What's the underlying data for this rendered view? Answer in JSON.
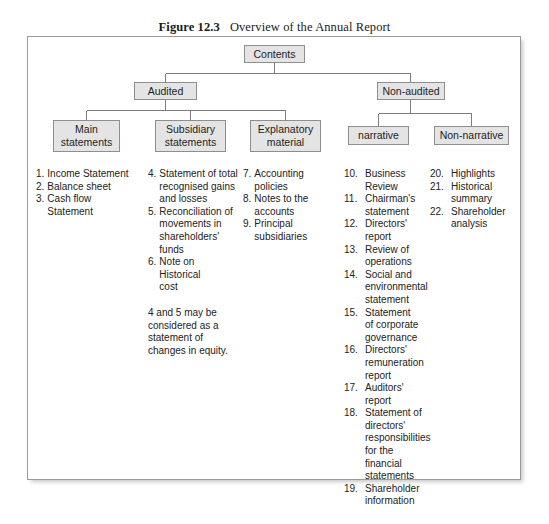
{
  "caption": {
    "figure_number": "Figure 12.3",
    "title": "Overview of the Annual Report"
  },
  "nodes": {
    "root": "Contents",
    "audited": "Audited",
    "non_audited": "Non-audited",
    "main_statements_l1": "Main",
    "main_statements_l2": "statements",
    "subsidiary_l1": "Subsidiary",
    "subsidiary_l2": "statements",
    "explanatory_l1": "Explanatory",
    "explanatory_l2": "material",
    "narrative": "narrative",
    "non_narrative": "Non-narrative"
  },
  "columns": {
    "main_statements": [
      {
        "num": "1.",
        "text": "Income Statement"
      },
      {
        "num": "2.",
        "text": "Balance sheet"
      },
      {
        "num": "3.",
        "text": "Cash flow Statement"
      }
    ],
    "subsidiary_statements": [
      {
        "num": "4.",
        "text": "Statement of total recognised gains and losses"
      },
      {
        "num": "5.",
        "text": "Reconciliation of movements in shareholders' funds"
      },
      {
        "num": "6.",
        "text": "Note on Historical cost"
      }
    ],
    "subsidiary_note": "4 and 5 may be considered as a statement of changes in equity.",
    "explanatory_material": [
      {
        "num": "7.",
        "text": "Accounting policies"
      },
      {
        "num": "8.",
        "text": "Notes to the accounts"
      },
      {
        "num": "9.",
        "text": "Principal subsidiaries"
      }
    ],
    "narrative": [
      {
        "num": "10.",
        "text": "Business Review"
      },
      {
        "num": "11.",
        "text": "Chairman's statement"
      },
      {
        "num": "12.",
        "text": "Directors' report"
      },
      {
        "num": "13.",
        "text": "Review of operations"
      },
      {
        "num": "14.",
        "text": "Social and environmental statement"
      },
      {
        "num": "15.",
        "text": "Statement of corporate governance"
      },
      {
        "num": "16.",
        "text": "Directors' remuneration report"
      },
      {
        "num": "17.",
        "text": "Auditors' report"
      },
      {
        "num": "18.",
        "text": "Statement of directors' responsibilities for the financial statements"
      },
      {
        "num": "19.",
        "text": "Shareholder information"
      }
    ],
    "non_narrative": [
      {
        "num": "20.",
        "text": "Highlights"
      },
      {
        "num": "21.",
        "text": "Historical summary"
      },
      {
        "num": "22.",
        "text": "Shareholder analysis"
      }
    ]
  },
  "colors": {
    "node_fill": "#e4e4e4",
    "node_border": "#8e8e8e",
    "frame_border": "#9a9a9a",
    "wire": "#7d7d7d",
    "text": "#222222"
  }
}
